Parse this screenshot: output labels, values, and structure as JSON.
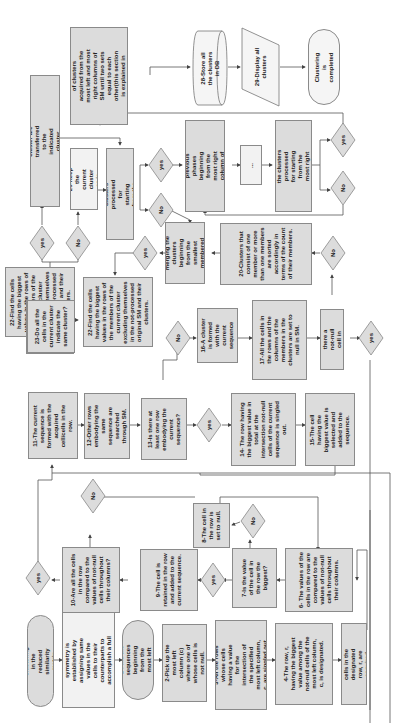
{
  "diagram": {
    "orientation": "rotated 90deg counter-clockwise",
    "nodes": {
      "start": "Begin clustering in the reduced similarity matrix (SM)",
      "symmetry": "A complete symmetry is established by assigning same values in the cells to their counterparts to accomplish a full symmetry",
      "n1": "1-Find the sequences beginning from the most left column",
      "n2": "2-Pick up the most left column (c) where one of whose cells is not null.",
      "n3": "3-All the rows whose cells having a value for the intersection of the specified most left column, c, are singled out",
      "n4": "4-The row, r, having the biggest value among the not-null cells of the most left column, c, is designated.",
      "n5": "5-Not-null cells in the designated row, r, are acquired",
      "n6": "6- The values of the cells in the row are compared to the values of not-null cells throughout their columns.",
      "n7": "7-Is the value of the cell in the row the biggest?",
      "n8": "8-The cell in the row is set to null.",
      "n9": "9-The cell is retained in the row and added to the current sequence.",
      "n10": "10-Are all the cells in the row compared to the values of not-null cells throughout their columns?",
      "n11": "11-The current sequence is formed with the acquired cell/cells in the row.",
      "n12": "12-Other rows embodying the same sequence are searched through SM.",
      "n13": "13-Is there at least one row embodying the current sequence?",
      "n14": "14- The row having the biggest value in total at the intersection not-null cells of the current sequence is singled out.",
      "n15": "15-The cell having the biggest value is selected and added to the sequence.",
      "n16": "16-A cluster is formed with the current sequence",
      "n17": "17-All the cells in the rows and the columns of the members in the clusters are set to null in SM.",
      "n18": "18-Is there a not-null cell in SM?",
      "n20": "20-Clusters that consist of one member or more than one members are sorted accordingly in terms of the count of their members.",
      "n21": "21-Start merging the clusters beginning from the smallest membered one.",
      "n22": "22-Find the cells having the biggest values in the rows of the members of the current cluster excluding themselves in the not-processed original SM and their clusters.",
      "n23": "23-Do all the cells in the current cluster indicate the same cluster?",
      "n24": "24-The members in the current cluster are transferred to the indicated cluster and current cluster is removed.",
      "n25": "25-Keep the current cluster as is.",
      "n26a": "26-Are all the clusters processed for starting from the most left column?",
      "n1b": "1-Do all the previous phases beginning from the most right column of SM as well",
      "ellipsis": "...",
      "n26b": "26-Are all the clusters processed for starting from the most right column?",
      "n27": "27-Forge two sets of clusters acquired from the most left and most right columns of SM until two sets equal to each other(this section is explained in pseudo code)",
      "n28": "28-Store all the clusters in DB",
      "n29": "29-Display all clusters",
      "end": "Clustering is completed"
    },
    "decisions": {
      "yes": "yes",
      "no": "No"
    }
  }
}
